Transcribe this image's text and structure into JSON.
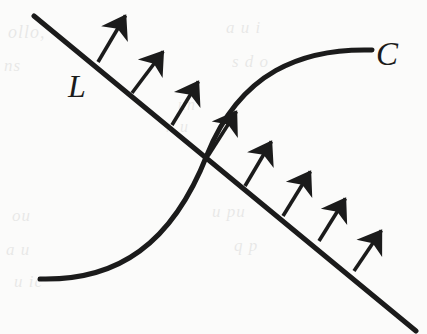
{
  "figure": {
    "name": "normal-vector-field-diagram",
    "width": 427,
    "height": 334,
    "background_color": "#fbfbfa",
    "ink_color": "#1b1b1b"
  },
  "labels": {
    "line_label": "L",
    "curve_label": "C"
  },
  "geometry": {
    "line": {
      "name": "L",
      "start": [
        34,
        16
      ],
      "end": [
        416,
        331
      ],
      "stroke_width": 5
    },
    "curve": {
      "name": "C",
      "type": "cubic-bezier-chain",
      "start": [
        40,
        279
      ],
      "control_1": [
        118,
        281
      ],
      "control_2": [
        170,
        240
      ],
      "mid": [
        207,
        155
      ],
      "control_3": [
        240,
        78
      ],
      "control_4": [
        300,
        50
      ],
      "end": [
        372,
        50
      ],
      "stroke_width": 5
    },
    "crossing_point": [
      207,
      155
    ],
    "arrow_direction_degrees": -58,
    "arrows": [
      {
        "base": [
          98,
          62
        ],
        "tip": [
          128,
          11
        ]
      },
      {
        "base": [
          132,
          93
        ],
        "tip": [
          166,
          47
        ]
      },
      {
        "base": [
          172,
          125
        ],
        "tip": [
          201,
          77
        ]
      },
      {
        "base": [
          208,
          156
        ],
        "tip": [
          239,
          107
        ]
      },
      {
        "base": [
          245,
          186
        ],
        "tip": [
          274,
          137
        ]
      },
      {
        "base": [
          283,
          216
        ],
        "tip": [
          313,
          167
        ]
      },
      {
        "base": [
          319,
          241
        ],
        "tip": [
          348,
          194
        ]
      },
      {
        "base": [
          354,
          271
        ],
        "tip": [
          384,
          226
        ]
      }
    ]
  },
  "bleed_text": {
    "note": "Faint show-through text from the reverse side of the printed page",
    "lines": [
      {
        "text": "ollo,",
        "x": 8,
        "y": 22,
        "size": 18
      },
      {
        "text": "a u i",
        "x": 226,
        "y": 18,
        "size": 17
      },
      {
        "text": "ns",
        "x": 4,
        "y": 56,
        "size": 17
      },
      {
        "text": "s d o",
        "x": 232,
        "y": 52,
        "size": 17
      },
      {
        "text": "un",
        "x": 178,
        "y": 96,
        "size": 16
      },
      {
        "text": "n u",
        "x": 166,
        "y": 118,
        "size": 16
      },
      {
        "text": "ou",
        "x": 12,
        "y": 206,
        "size": 17
      },
      {
        "text": "u  pu",
        "x": 212,
        "y": 202,
        "size": 17
      },
      {
        "text": "a u",
        "x": 6,
        "y": 240,
        "size": 17
      },
      {
        "text": "q p",
        "x": 234,
        "y": 236,
        "size": 17
      },
      {
        "text": "u ic",
        "x": 14,
        "y": 272,
        "size": 17
      }
    ]
  }
}
